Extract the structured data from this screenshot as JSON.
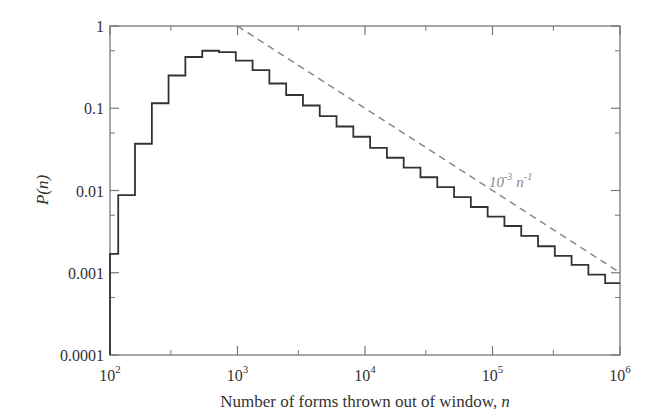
{
  "chart_data": {
    "type": "line",
    "subtype": "step-histogram",
    "title": "",
    "xlabel": "Number of forms thrown out of window, n",
    "xlabel_text": "Number of forms thrown out of window,",
    "xlabel_var": "n",
    "ylabel": "P(n)",
    "xscale": "log",
    "yscale": "log",
    "xlim": [
      100,
      1000000
    ],
    "ylim": [
      0.0001,
      1
    ],
    "grid": false,
    "legend": null,
    "x_ticks": [
      {
        "value": 100,
        "base": "10",
        "exp": "2"
      },
      {
        "value": 1000,
        "base": "10",
        "exp": "3"
      },
      {
        "value": 10000,
        "base": "10",
        "exp": "4"
      },
      {
        "value": 100000,
        "base": "10",
        "exp": "5"
      },
      {
        "value": 1000000,
        "base": "10",
        "exp": "6"
      }
    ],
    "y_ticks": [
      {
        "value": 1,
        "label": "1"
      },
      {
        "value": 0.1,
        "label": "0.1"
      },
      {
        "value": 0.01,
        "label": "0.01"
      },
      {
        "value": 0.001,
        "label": "0.001"
      },
      {
        "value": 0.0001,
        "label": "0.0001"
      }
    ],
    "series": [
      {
        "name": "P(n) histogram",
        "style": "step",
        "color": "#333333",
        "bin_edges": [
          100,
          116,
          157,
          213,
          288,
          390,
          529,
          716,
          970,
          1313,
          1778,
          2408,
          3261,
          4416,
          5980,
          8098,
          10967,
          14852,
          20112,
          27236,
          36883,
          49948,
          67640,
          91599,
          124045,
          167983,
          227483,
          308059,
          417177,
          564946,
          765054,
          1000000
        ],
        "values": [
          0.0017,
          0.0088,
          0.037,
          0.115,
          0.25,
          0.42,
          0.5,
          0.48,
          0.38,
          0.29,
          0.2,
          0.145,
          0.108,
          0.08,
          0.06,
          0.045,
          0.033,
          0.025,
          0.019,
          0.0145,
          0.011,
          0.0083,
          0.0063,
          0.0048,
          0.0037,
          0.0028,
          0.0021,
          0.0016,
          0.00125,
          0.00095,
          0.00075
        ]
      },
      {
        "name": "10^-3 n^-1 reference",
        "style": "dashed",
        "color": "#888888",
        "x": [
          1000,
          1000000
        ],
        "values": [
          1,
          0.001
        ]
      }
    ],
    "annotations": [
      {
        "text": "10^-3 n^-1",
        "base1": "10",
        "exp1": "-3",
        "base2": "n",
        "exp2": "-1",
        "x": 300000,
        "y": 0.03
      }
    ]
  }
}
